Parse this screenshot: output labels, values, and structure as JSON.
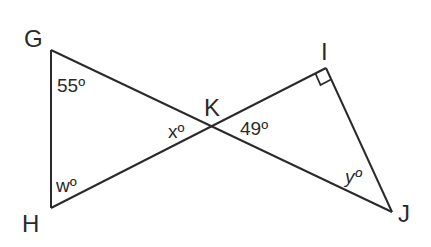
{
  "diagram": {
    "type": "geometry",
    "stroke_color": "#2a2a2a",
    "vertices": {
      "G": {
        "label": "G",
        "x": 51,
        "y": 50
      },
      "H": {
        "label": "H",
        "x": 51,
        "y": 208
      },
      "K": {
        "label": "K",
        "x": 211,
        "y": 126
      },
      "I": {
        "label": "I",
        "x": 326,
        "y": 68
      },
      "J": {
        "label": "J",
        "x": 392,
        "y": 212
      }
    },
    "segments": [
      [
        "G",
        "H"
      ],
      [
        "G",
        "J"
      ],
      [
        "H",
        "I"
      ],
      [
        "I",
        "J"
      ]
    ],
    "angles": {
      "G": {
        "text": "55º",
        "value": 55
      },
      "H": {
        "text": "wº",
        "variable": "w"
      },
      "K_left": {
        "text": "xº",
        "variable": "x"
      },
      "K_right": {
        "text": "49º",
        "value": 49
      },
      "J": {
        "text": "yº",
        "variable": "y"
      },
      "I": {
        "marker": "right-angle",
        "value": 90
      }
    }
  }
}
